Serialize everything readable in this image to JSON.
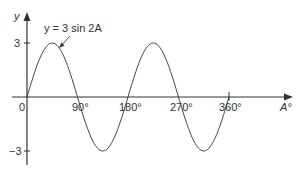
{
  "chart_data": {
    "type": "line",
    "title": "",
    "annotation": "y = 3 sin 2A",
    "xlabel": "A°",
    "ylabel": "y",
    "x_ticks": [
      "0",
      "90°",
      "180°",
      "270°",
      "360°"
    ],
    "y_ticks": [
      "3",
      "−3"
    ],
    "xlim": [
      0,
      360
    ],
    "ylim": [
      -3,
      3
    ],
    "grid": false,
    "series": [
      {
        "name": "y = 3 sin 2A",
        "x": [
          0,
          45,
          90,
          135,
          180,
          225,
          270,
          315,
          360
        ],
        "values": [
          0,
          3,
          0,
          -3,
          0,
          3,
          0,
          -3,
          0
        ]
      }
    ]
  },
  "labels": {
    "y_axis": "y",
    "x_axis": "A°",
    "origin": "0",
    "x90": "90°",
    "x180": "180°",
    "x270": "270°",
    "x360": "360°",
    "y_pos": "3",
    "y_neg": "−3",
    "equation": "y = 3 sin 2A"
  }
}
